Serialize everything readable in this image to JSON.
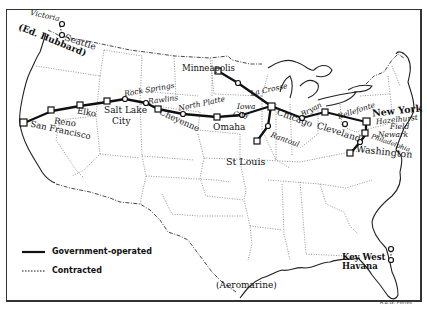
{
  "map": {
    "title": "US Air Mail Routes",
    "cities": {
      "victoria": "Victoria",
      "seattle": "Seattle",
      "ed_hubbard": "(Ed. Hubbard)",
      "san_francisco": "San Francisco",
      "reno": "Reno",
      "elko": "Elko",
      "salt_lake_city_1": "Salt Lake",
      "salt_lake_city_2": "City",
      "rock_springs": "Rock Springs",
      "rawlins": "Rawlins",
      "cheyenne": "Cheyenne",
      "north_platte": "North Platte",
      "omaha": "Omaha",
      "iowa_city_1": "Iowa",
      "iowa_city_2": "City",
      "minneapolis": "Minneapolis",
      "la_crosse": "La Crosse",
      "chicago": "Chicago",
      "st_louis": "St Louis",
      "rantoul": "Rantoul",
      "bryan": "Bryan",
      "cleveland": "Cleveland",
      "bellefonte": "Bellefonte",
      "new_york": "New York",
      "hazelhurst_field_1": "Hazelhurst",
      "hazelhurst_field_2": "Field",
      "newark": "Newark",
      "philadelphia": "Philadelphia",
      "washington": "Washington",
      "aeromarine": "(Aeromarine)",
      "key_west": "Key West",
      "havana": "Havana"
    },
    "legend": {
      "government": "Government-operated",
      "contracted": "Contracted"
    },
    "credit": "R.E.G. Peries",
    "colors": {
      "ink": "#111111",
      "background": "#ffffff"
    }
  }
}
